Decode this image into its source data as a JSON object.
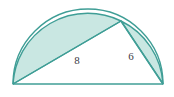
{
  "figure": {
    "background_color": "#ffffff",
    "stroke_color": "#3f9e96",
    "fill_color": "#bfe3dd",
    "fill_opacity": "0.85",
    "label_color": "#3b3b45",
    "stroke_width": "1.4"
  },
  "geometry": {
    "semicircle": {
      "center_x": 88,
      "center_y": 84,
      "radius": 75,
      "left_endpoint_x": 13,
      "left_endpoint_y": 84,
      "right_endpoint_x": 163,
      "right_endpoint_y": 84,
      "top_y": 9
    },
    "triangle": {
      "vertex_left_x": 13,
      "vertex_left_y": 84,
      "vertex_right_x": 163,
      "vertex_right_y": 84,
      "vertex_apex_x": 121,
      "vertex_apex_y": 21
    }
  },
  "labels": {
    "leg_long": {
      "text": "8",
      "x": 77,
      "y": 61
    },
    "leg_short": {
      "text": "6",
      "x": 131,
      "y": 57
    }
  },
  "shaded_regions": {
    "left_lune_name": "left-lune",
    "right_lune_name": "right-lune"
  }
}
